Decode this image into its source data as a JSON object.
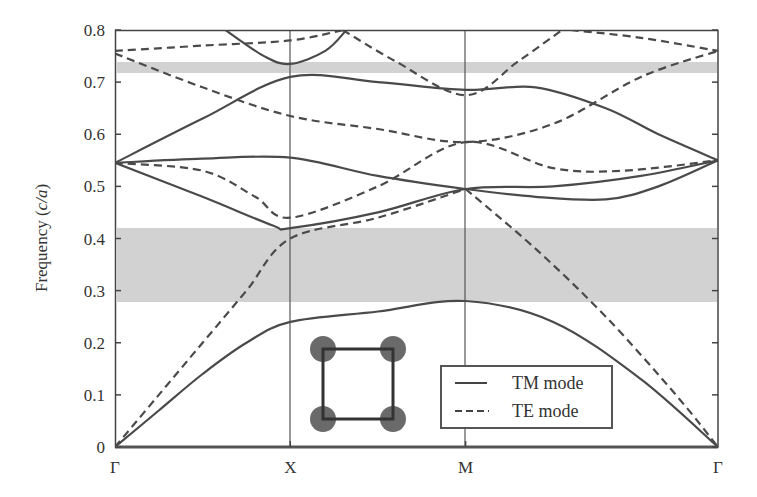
{
  "chart_data": {
    "type": "line",
    "title": "",
    "xlabel": "",
    "ylabel": "Frequency (c/a)",
    "ylabel_parts": {
      "prefix": "Frequency (",
      "italic": "c/a",
      "suffix": ")"
    },
    "ylim": [
      0,
      0.8
    ],
    "yticks": [
      "0",
      "0.1",
      "0.2",
      "0.3",
      "0.4",
      "0.5",
      "0.6",
      "0.7",
      "0.8"
    ],
    "ytick_values": [
      0,
      0.1,
      0.2,
      0.3,
      0.4,
      0.5,
      0.6,
      0.7,
      0.8
    ],
    "x_symmetry_points": [
      "Γ",
      "X",
      "M",
      "Γ"
    ],
    "x_positions": [
      0,
      1,
      2,
      3.44
    ],
    "grid": false,
    "vertical_lines_at": [
      "X",
      "M"
    ],
    "band_gaps": [
      {
        "from": 0.28,
        "to": 0.42,
        "color": "#d4d4d4"
      },
      {
        "from": 0.712,
        "to": 0.733,
        "color": "#d4d4d4"
      }
    ],
    "legend": {
      "position": "lower right",
      "entries": [
        {
          "label": "TM mode",
          "style": "solid"
        },
        {
          "label": "TE mode",
          "style": "dashed"
        }
      ]
    },
    "inset": {
      "description": "square lattice unit cell with four circular rods at the corners"
    },
    "series": [
      {
        "name": "TM mode",
        "style": "solid",
        "bands": [
          {
            "x": [
              0,
              0.25,
              0.5,
              0.75,
              1,
              1.5,
              2,
              2.5,
              3,
              3.44
            ],
            "y": [
              0,
              0.07,
              0.14,
              0.2,
              0.24,
              0.26,
              0.28,
              0.24,
              0.13,
              0
            ]
          },
          {
            "x": [
              0,
              0.5,
              0.9,
              1,
              1.5,
              2,
              2.5,
              3,
              3.44
            ],
            "y": [
              0.545,
              0.48,
              0.425,
              0.42,
              0.45,
              0.495,
              0.5,
              0.52,
              0.55
            ]
          },
          {
            "x": [
              0,
              0.5,
              1,
              1.5,
              2,
              2.4,
              2.8,
              3.1,
              3.44
            ],
            "y": [
              0.545,
              0.553,
              0.555,
              0.52,
              0.495,
              0.48,
              0.475,
              0.5,
              0.55
            ]
          },
          {
            "x": [
              0,
              0.5,
              1,
              1.5,
              2,
              2.4,
              2.8,
              3.1,
              3.44
            ],
            "y": [
              0.545,
              0.63,
              0.71,
              0.7,
              0.685,
              0.69,
              0.65,
              0.6,
              0.55
            ]
          },
          {
            "x": [
              0.63,
              0.85,
              1,
              1.2,
              1.32
            ],
            "y": [
              0.8,
              0.75,
              0.735,
              0.76,
              0.8
            ]
          }
        ]
      },
      {
        "name": "TE mode",
        "style": "dashed",
        "bands": [
          {
            "x": [
              0,
              0.25,
              0.5,
              0.75,
              1,
              1.5,
              2
            ],
            "y": [
              0,
              0.1,
              0.2,
              0.3,
              0.4,
              0.44,
              0.495
            ]
          },
          {
            "x": [
              2,
              2.4,
              2.8,
              3.2,
              3.44
            ],
            "y": [
              0.495,
              0.38,
              0.25,
              0.1,
              0
            ]
          },
          {
            "x": [
              0,
              0.5,
              0.8,
              1,
              1.5,
              2,
              2.5,
              2.9,
              3.44
            ],
            "y": [
              0.545,
              0.53,
              0.48,
              0.44,
              0.5,
              0.585,
              0.535,
              0.53,
              0.55
            ]
          },
          {
            "x": [
              0,
              0.5,
              1,
              1.5,
              2,
              2.5,
              3,
              3.44
            ],
            "y": [
              0.755,
              0.69,
              0.635,
              0.61,
              0.585,
              0.62,
              0.71,
              0.76
            ]
          },
          {
            "x": [
              0,
              0.5,
              1,
              1.3
            ],
            "y": [
              0.76,
              0.77,
              0.78,
              0.8
            ]
          },
          {
            "x": [
              1.3,
              1.6,
              2,
              2.3,
              2.55
            ],
            "y": [
              0.8,
              0.74,
              0.675,
              0.74,
              0.8
            ]
          },
          {
            "x": [
              2.6,
              3,
              3.44
            ],
            "y": [
              0.8,
              0.785,
              0.76
            ]
          }
        ]
      }
    ]
  },
  "legend": {
    "tm_label": "TM mode",
    "te_label": "TE mode"
  },
  "axis": {
    "ylabel_prefix": "Frequency (",
    "ylabel_italic": "c/a",
    "ylabel_suffix": ")",
    "x_labels": [
      "Γ",
      "X",
      "M",
      "Γ"
    ],
    "y_labels": [
      "0",
      "0.1",
      "0.2",
      "0.3",
      "0.4",
      "0.5",
      "0.6",
      "0.7",
      "0.8"
    ]
  }
}
